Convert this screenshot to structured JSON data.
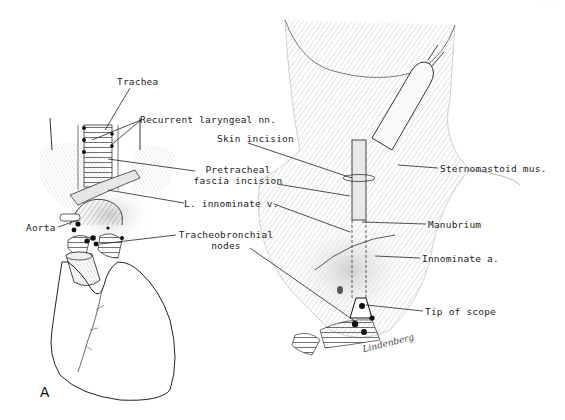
{
  "figure": {
    "panel_letter": "A",
    "signature": "Lindenberg",
    "corner_text": "· · · · · ·"
  },
  "labels": {
    "trachea": "Trachea",
    "recurrent_laryngeal": "Recurrent laryngeal nn.",
    "skin_incision": "Skin incision",
    "pretracheal_line1": "Pretracheal",
    "pretracheal_line2": "fascia incision",
    "sternomastoid": "Sternomastoid mus.",
    "l_innominate_v": "L. innominate v.",
    "manubrium": "Manubrium",
    "aorta": "Aorta",
    "tracheobronchial_line1": "Tracheobronchial",
    "tracheobronchial_line2": "nodes",
    "innominate_a": "Innominate a.",
    "tip_of_scope": "Tip of scope"
  },
  "colors": {
    "ink": "#1a1a1a",
    "shade": "#9a9a9a",
    "light_shade": "#d6d6d6",
    "background": "#ffffff"
  }
}
